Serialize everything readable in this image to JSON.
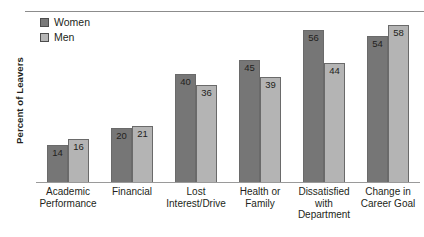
{
  "chart_data": {
    "type": "bar",
    "title": "",
    "xlabel": "",
    "ylabel": "Percent of Leavers",
    "ylim": [
      0,
      62
    ],
    "grid": false,
    "legend_position": "top-left",
    "categories": [
      "Academic Performance",
      "Financial",
      "Lost Interest/Drive",
      "Health or Family",
      "Dissatisfied with Department",
      "Change in Career Goal"
    ],
    "series": [
      {
        "name": "Women",
        "color": "#767676",
        "values": [
          14,
          20,
          40,
          45,
          56,
          54
        ]
      },
      {
        "name": "Men",
        "color": "#b4b4b4",
        "values": [
          16,
          21,
          36,
          39,
          44,
          58
        ]
      }
    ]
  },
  "legend": {
    "items": [
      {
        "label": "Women"
      },
      {
        "label": "Men"
      }
    ]
  },
  "axis": {
    "y_title": "Percent of Leavers"
  },
  "corner": {
    "mark": ""
  }
}
